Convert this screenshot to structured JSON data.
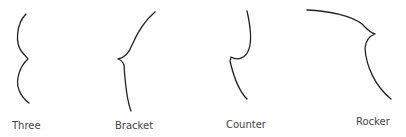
{
  "figure": {
    "stroke_color": "#222222",
    "label_color": "#444444",
    "shapes": [
      {
        "id": "three",
        "label": "Three"
      },
      {
        "id": "bracket",
        "label": "Bracket"
      },
      {
        "id": "counter",
        "label": "Counter"
      },
      {
        "id": "rocker",
        "label": "Rocker"
      }
    ]
  }
}
